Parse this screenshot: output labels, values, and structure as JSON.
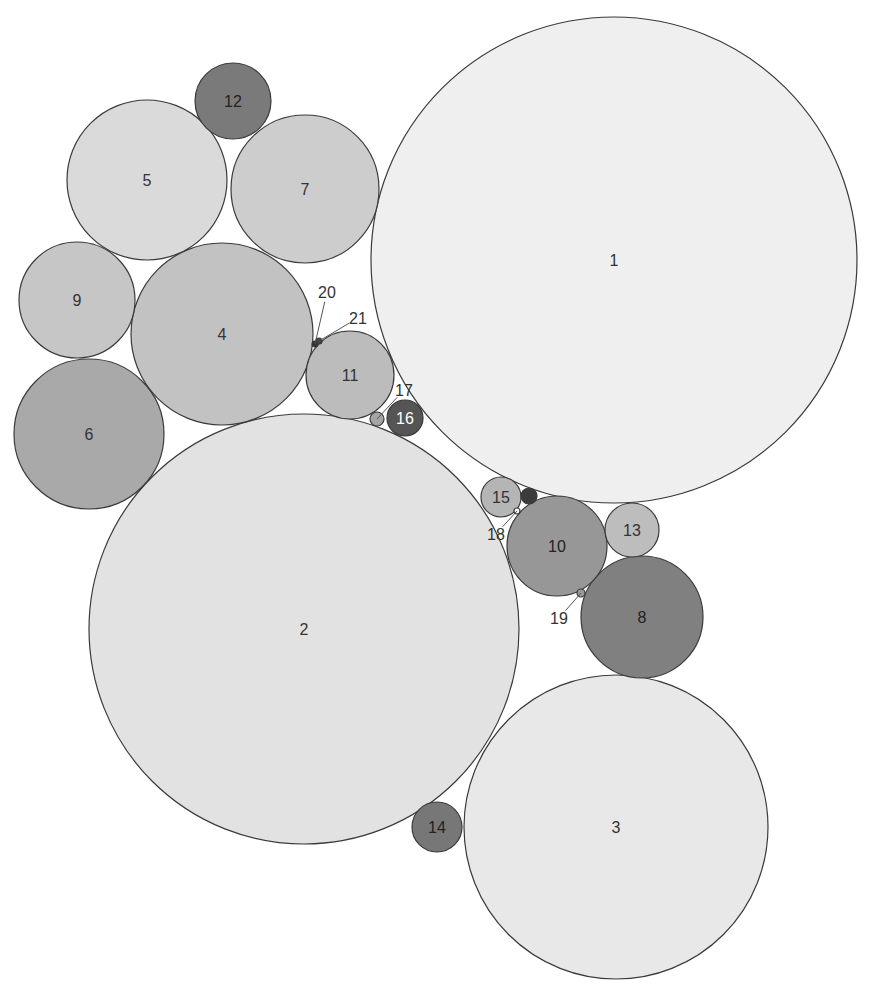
{
  "chart_data": {
    "type": "packed-circles",
    "title": "",
    "circles": [
      {
        "id": "1",
        "label": "1",
        "cx": 614,
        "cy": 260,
        "r": 243,
        "fill": "#efefef",
        "text": "#333333"
      },
      {
        "id": "2",
        "label": "2",
        "cx": 304,
        "cy": 629,
        "r": 215,
        "fill": "#e2e2e2",
        "text": "#333333"
      },
      {
        "id": "3",
        "label": "3",
        "cx": 616,
        "cy": 827,
        "r": 152,
        "fill": "#e8e8e8",
        "text": "#333333"
      },
      {
        "id": "4",
        "label": "4",
        "cx": 222,
        "cy": 334,
        "r": 91,
        "fill": "#c2c2c2",
        "text": "#333333"
      },
      {
        "id": "5",
        "label": "5",
        "cx": 147,
        "cy": 180,
        "r": 80,
        "fill": "#dadada",
        "text": "#333333"
      },
      {
        "id": "6",
        "label": "6",
        "cx": 89,
        "cy": 434,
        "r": 75,
        "fill": "#a9a9a9",
        "text": "#333333"
      },
      {
        "id": "7",
        "label": "7",
        "cx": 305,
        "cy": 189,
        "r": 74,
        "fill": "#cdcdcd",
        "text": "#333333"
      },
      {
        "id": "8",
        "label": "8",
        "cx": 642,
        "cy": 617,
        "r": 61,
        "fill": "#808080",
        "text": "#222222"
      },
      {
        "id": "9",
        "label": "9",
        "cx": 77,
        "cy": 300,
        "r": 58,
        "fill": "#c6c6c6",
        "text": "#333333"
      },
      {
        "id": "10",
        "label": "10",
        "cx": 557,
        "cy": 546,
        "r": 50,
        "fill": "#979797",
        "text": "#222222"
      },
      {
        "id": "11",
        "label": "11",
        "cx": 350,
        "cy": 375,
        "r": 44,
        "fill": "#bcbcbc",
        "text": "#333333"
      },
      {
        "id": "12",
        "label": "12",
        "cx": 233,
        "cy": 101,
        "r": 38,
        "fill": "#7a7a7a",
        "text": "#222222"
      },
      {
        "id": "13",
        "label": "13",
        "cx": 632,
        "cy": 530,
        "r": 27,
        "fill": "#bdbdbd",
        "text": "#333333"
      },
      {
        "id": "14",
        "label": "14",
        "cx": 437,
        "cy": 827,
        "r": 25,
        "fill": "#777777",
        "text": "#222222"
      },
      {
        "id": "15",
        "label": "15",
        "cx": 501,
        "cy": 497,
        "r": 20,
        "fill": "#b5b5b5",
        "text": "#333333"
      },
      {
        "id": "16",
        "label": "16",
        "cx": 405,
        "cy": 418,
        "r": 18,
        "fill": "#555555",
        "text": "#ffffff"
      },
      {
        "id": "17",
        "label": "17",
        "cx": 377,
        "cy": 419,
        "r": 7,
        "fill": "#a5a5a5",
        "text": "#333333",
        "label_x": 404,
        "label_y": 390
      },
      {
        "id": "18",
        "label": "18",
        "cx": 517,
        "cy": 511,
        "r": 3,
        "fill": "#f5f5f5",
        "text": "#333333",
        "label_x": 496,
        "label_y": 534
      },
      {
        "id": "19",
        "label": "19",
        "cx": 581,
        "cy": 593,
        "r": 4,
        "fill": "#9a9a9a",
        "text": "#333333",
        "label_x": 559,
        "label_y": 618
      },
      {
        "id": "20",
        "label": "20",
        "cx": 315,
        "cy": 344,
        "r": 3,
        "fill": "#333333",
        "text": "#333333",
        "label_x": 327,
        "label_y": 292
      },
      {
        "id": "21",
        "label": "21",
        "cx": 319,
        "cy": 341,
        "r": 3,
        "fill": "#444444",
        "text": "#333333",
        "label_x": 358,
        "label_y": 318
      },
      {
        "id": "x",
        "label": "",
        "cx": 529,
        "cy": 496,
        "r": 8,
        "fill": "#3c3c3c",
        "text": "#333333"
      }
    ]
  }
}
